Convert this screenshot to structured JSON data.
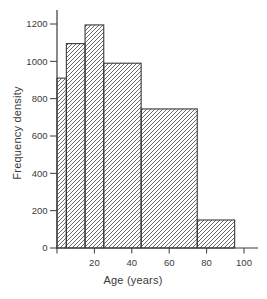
{
  "figure": {
    "background": "#ffffff",
    "ink": "#3a3a3a",
    "bar_fill": "#ffffff"
  },
  "chart_data": {
    "type": "bar",
    "variant": "histogram",
    "title": "",
    "xlabel": "Age (years)",
    "ylabel": "Frequency density",
    "x_ticks": [
      20,
      40,
      60,
      80,
      100
    ],
    "y_ticks": [
      0,
      200,
      400,
      600,
      800,
      1000,
      1200
    ],
    "xlim": [
      0,
      108
    ],
    "ylim": [
      0,
      1280
    ],
    "grid": false,
    "legend": false,
    "bins": [
      {
        "from": 0,
        "to": 5,
        "frequency_density": 910
      },
      {
        "from": 5,
        "to": 15,
        "frequency_density": 1095
      },
      {
        "from": 15,
        "to": 25,
        "frequency_density": 1195
      },
      {
        "from": 25,
        "to": 45,
        "frequency_density": 990
      },
      {
        "from": 45,
        "to": 75,
        "frequency_density": 745
      },
      {
        "from": 75,
        "to": 95,
        "frequency_density": 150
      }
    ],
    "bar_style": {
      "hatch": "diagonal-forward-slash",
      "hatch_spacing_px": 4,
      "stroke": "#3a3a3a",
      "fill": "#ffffff"
    }
  }
}
